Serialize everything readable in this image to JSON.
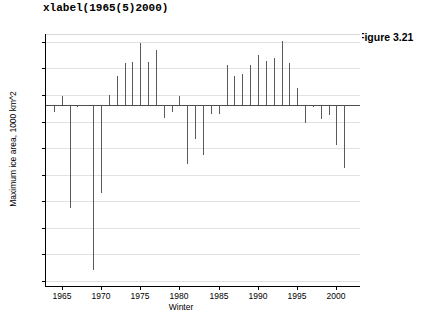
{
  "code_label": "xlabel(1965(5)2000)",
  "figure_caption": "Figure 3.21",
  "chart_data": {
    "type": "bar",
    "title": "",
    "xlabel": "Winter",
    "ylabel": "Maximum ice area, 1000 km^2",
    "xlim": [
      1963,
      2003
    ],
    "ylim": [
      36,
      226
    ],
    "ytick_values": [
      40,
      60,
      80,
      100,
      120,
      140,
      160,
      180,
      200,
      220
    ],
    "ytick_labels": [
      "40",
      "60",
      "80",
      "100",
      "120",
      "140",
      "160",
      "180",
      "200",
      "220"
    ],
    "xtick_values": [
      1965,
      1970,
      1975,
      1980,
      1985,
      1990,
      1995,
      2000
    ],
    "xtick_labels": [
      "1965",
      "1970",
      "1975",
      "1980",
      "1985",
      "1990",
      "1995",
      "2000"
    ],
    "grid": true,
    "grid_axis": "y",
    "baseline": 172.5,
    "bar_color": "#5a5a5a",
    "baseline_color": "#4d4d4d",
    "grid_color": "#e2e2e2",
    "categories": [
      1964,
      1965,
      1966,
      1967,
      1968,
      1969,
      1970,
      1971,
      1972,
      1973,
      1974,
      1975,
      1976,
      1977,
      1978,
      1979,
      1980,
      1981,
      1982,
      1983,
      1984,
      1985,
      1986,
      1987,
      1988,
      1989,
      1990,
      1991,
      1992,
      1993,
      1994,
      1995,
      1996,
      1997,
      1998,
      1999,
      2000,
      2001
    ],
    "values": [
      167,
      179,
      95,
      171,
      172,
      48,
      106,
      180,
      194,
      204,
      205,
      219,
      205,
      214,
      163,
      167,
      179,
      128,
      147,
      135,
      166,
      166,
      203,
      194,
      196,
      203,
      210,
      206,
      208,
      221,
      204,
      185,
      159,
      171,
      162,
      165,
      142,
      125
    ]
  }
}
